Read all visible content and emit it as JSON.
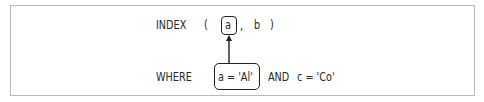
{
  "diagram": {
    "index_row": {
      "keyword": "INDEX",
      "open_paren": "(",
      "highlighted_column": "a",
      "separator": ",",
      "other_column": "b",
      "close_paren": ")"
    },
    "where_row": {
      "keyword": "WHERE",
      "highlighted_condition": "a = 'Al'",
      "conjunction": "AND",
      "other_condition": "c = 'Co'"
    },
    "arrow": {
      "from": "a = 'Al'",
      "to": "a",
      "color": "#222222"
    },
    "frame_color": "#b9b9b9"
  }
}
